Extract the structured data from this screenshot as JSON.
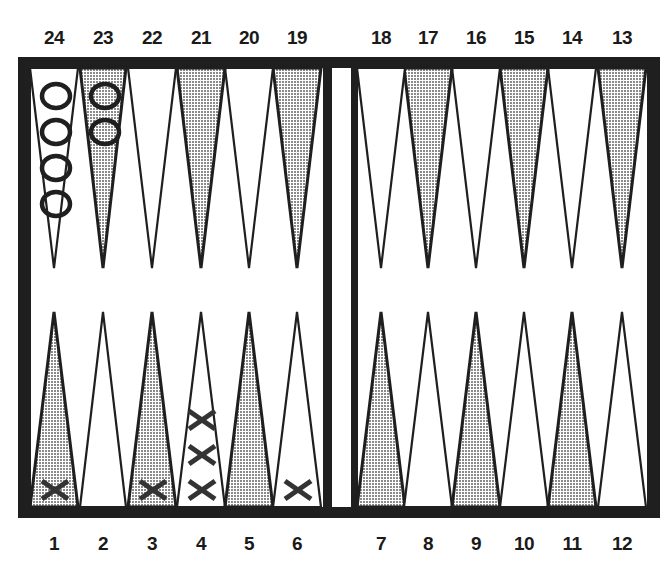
{
  "colors": {
    "ink": "#1f1f1f",
    "shaded_point": "#bdbdbd",
    "board_bg": "#ffffff"
  },
  "labels": {
    "top": [
      "24",
      "23",
      "22",
      "21",
      "20",
      "19",
      "18",
      "17",
      "16",
      "15",
      "14",
      "13"
    ],
    "bottom": [
      "1",
      "2",
      "3",
      "4",
      "5",
      "6",
      "7",
      "8",
      "9",
      "10",
      "11",
      "12"
    ]
  },
  "checkers": {
    "O": [
      {
        "point": 24,
        "count": 4
      },
      {
        "point": 23,
        "count": 2
      }
    ],
    "X": [
      {
        "point": 1,
        "count": 1
      },
      {
        "point": 3,
        "count": 1
      },
      {
        "point": 4,
        "count": 3
      },
      {
        "point": 6,
        "count": 1
      }
    ]
  }
}
